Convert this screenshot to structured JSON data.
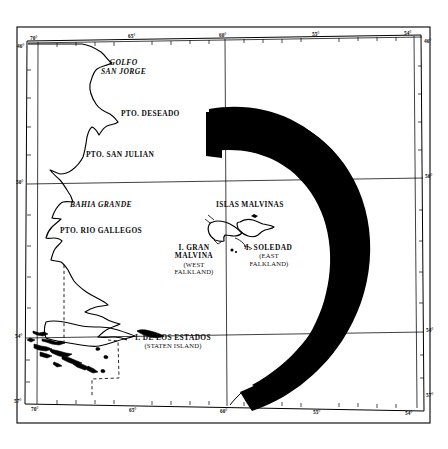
{
  "figure": {
    "kind": "map",
    "region": "Southern Patagonia and the Falkland Islands / Islas Malvinas",
    "style": "scanned black-and-white line map",
    "ink_color": "#000000",
    "background_color": "#ffffff"
  },
  "graticule": {
    "latitude_labels_left": [
      "46°",
      "50°",
      "54°",
      "57°"
    ],
    "latitude_labels_right": [
      "46°",
      "50°",
      "54°",
      "57°"
    ],
    "longitude_labels_top": [
      "70°",
      "65°",
      "60°",
      "55°",
      "54°"
    ],
    "longitude_labels_bottom": [
      "70°",
      "65°",
      "60°",
      "55°",
      "54°"
    ],
    "corner_left_top": "46°",
    "corner_left_bottom": "57°",
    "corner_right_top": "46°",
    "corner_right_bottom": "57°"
  },
  "labels": {
    "golfo_san_jorge": {
      "line1": "GOLFO",
      "line2": "SAN JORGE"
    },
    "pto_deseado": "PTO. DESEADO",
    "pto_san_julian": "PTO. SAN JULIAN",
    "bahia_grande": "BAHIA GRANDE",
    "pto_rio_gallegos": "PTO. RIO GALLEGOS",
    "islas_malvinas": "ISLAS MALVINAS",
    "gran_malvina": {
      "line1": "I. GRAN",
      "line2": "MALVINA",
      "line3": "(WEST",
      "line4": "FALKLAND)"
    },
    "soledad": {
      "line1": "I. SOLEDAD",
      "line2": "(EAST",
      "line3": "FALKLAND)"
    },
    "estados": {
      "line1": "I. DE LOS ESTADOS",
      "line2": "(STATEN ISLAND)"
    }
  },
  "features": {
    "exclusion_zone": "solid black crescent arc surrounding the Falkland Islands, open toward the west",
    "coastline": "Argentine Atlantic coast from Golfo San Jorge south to Tierra del Fuego",
    "boundary": "dashed Argentina-Chile border across Tierra del Fuego",
    "archipelago": "Tierra del Fuego island group at lower left"
  }
}
